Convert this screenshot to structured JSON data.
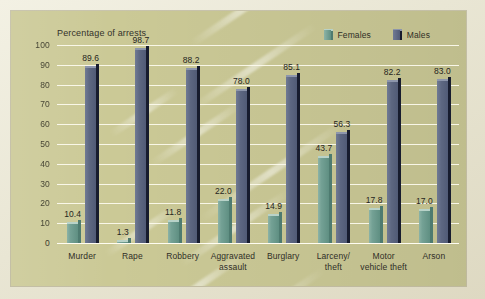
{
  "chart_data": {
    "type": "bar",
    "title": "Percentage of arrests",
    "xlabel": "",
    "ylabel": "Percentage of arrests",
    "ylim": [
      0,
      100
    ],
    "ytick_step": 10,
    "yticks": [
      "100",
      "90",
      "80",
      "70",
      "60",
      "50",
      "40",
      "30",
      "20",
      "10",
      "0"
    ],
    "grid": true,
    "legend_position": "top-right",
    "categories": [
      "Murder",
      "Rape",
      "Robbery",
      "Aggravated assault",
      "Burglary",
      "Larceny/ theft",
      "Motor vehicle theft",
      "Arson"
    ],
    "category_lines": [
      [
        "Murder"
      ],
      [
        "Rape"
      ],
      [
        "Robbery"
      ],
      [
        "Aggravated",
        "assault"
      ],
      [
        "Burglary"
      ],
      [
        "Larceny/",
        "theft"
      ],
      [
        "Motor",
        "vehicle theft"
      ],
      [
        "Arson"
      ]
    ],
    "series": [
      {
        "name": "Females",
        "color": "#6f9d90",
        "values": [
          10.4,
          1.3,
          11.8,
          22.0,
          14.9,
          43.7,
          17.8,
          17.0
        ],
        "labels": [
          "10.4",
          "1.3",
          "11.8",
          "22.0",
          "14.9",
          "43.7",
          "17.8",
          "17.0"
        ]
      },
      {
        "name": "Males",
        "color": "#5d6781",
        "values": [
          89.6,
          98.7,
          88.2,
          78.0,
          85.1,
          56.3,
          82.2,
          83.0
        ],
        "labels": [
          "89.6",
          "98.7",
          "88.2",
          "78.0",
          "85.1",
          "56.3",
          "82.2",
          "83.0"
        ]
      }
    ]
  },
  "legend": {
    "items": [
      {
        "label": "Females",
        "color": "#6f9d90"
      },
      {
        "label": "Males",
        "color": "#5d6781"
      }
    ]
  },
  "colors": {
    "panel_background": "#cbc996",
    "page_background": "#efeddd",
    "gridline": "#fdfbef",
    "text": "#2f2e26",
    "female_bar": "#6f9d90",
    "male_bar": "#5d6781",
    "male_bar_edge": "#171c2e"
  }
}
